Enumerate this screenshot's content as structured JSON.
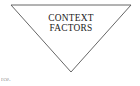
{
  "canvas": {
    "width": 140,
    "height": 86,
    "background_color": "#ffffff"
  },
  "diagram": {
    "shape": {
      "name": "inverted-triangle",
      "stroke_color": "#555555",
      "fill_color": "#ffffff",
      "points": "11,5 131,5 71,72"
    },
    "label": {
      "line1": "CONTEXT",
      "line2": "FACTORS",
      "color": "#1a1a1a"
    }
  },
  "footer": {
    "source_fragment": "rce."
  }
}
